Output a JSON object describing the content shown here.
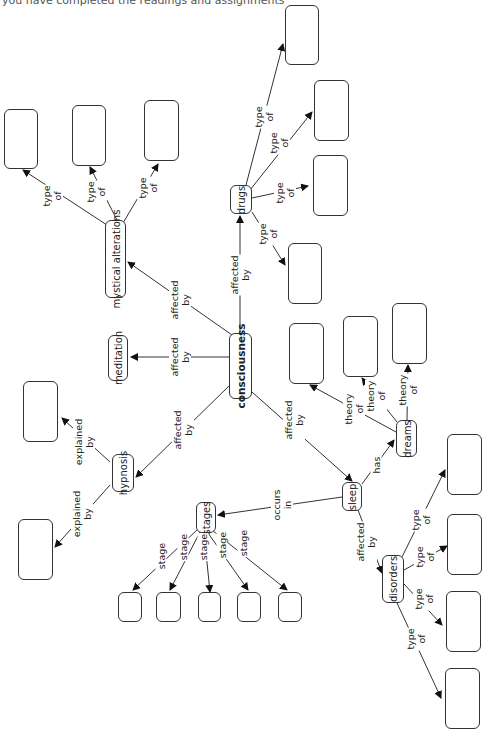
{
  "caption": "you have completed the readings and assignments",
  "concepts": {
    "consciousness": "consciousness",
    "mystical": "mystical alterations",
    "meditation": "meditation",
    "drugs": "drugs",
    "hypnosis": "hypnosis",
    "stages": "stages",
    "sleep": "sleep",
    "dreams": "dreams",
    "disorders": "disorders"
  },
  "links": {
    "affected_by": [
      "affected",
      "by"
    ],
    "type_of": [
      "type",
      "of"
    ],
    "explained_by": [
      "explained",
      "by"
    ],
    "theory_of": [
      "theory",
      "of"
    ],
    "stage": [
      "stage"
    ],
    "occurs_in": [
      "occurs",
      "in"
    ],
    "has": [
      "has"
    ]
  },
  "edge_labels": [
    {
      "id": "c-myst",
      "l1": "affected",
      "l2": "by"
    },
    {
      "id": "c-med",
      "l1": "affected",
      "l2": "by"
    },
    {
      "id": "c-drugs",
      "l1": "affected",
      "l2": "by"
    },
    {
      "id": "c-hyp",
      "l1": "affected",
      "l2": "by"
    },
    {
      "id": "c-sleep",
      "l1": "affected",
      "l2": "by"
    },
    {
      "id": "m-1",
      "l1": "type",
      "l2": "of"
    },
    {
      "id": "m-2",
      "l1": "type",
      "l2": "of"
    },
    {
      "id": "m-3",
      "l1": "type",
      "l2": "of"
    },
    {
      "id": "d-1",
      "l1": "type",
      "l2": "of"
    },
    {
      "id": "d-2",
      "l1": "type",
      "l2": "of"
    },
    {
      "id": "d-3",
      "l1": "type",
      "l2": "of"
    },
    {
      "id": "d-4",
      "l1": "type",
      "l2": "of"
    },
    {
      "id": "h-1",
      "l1": "explained",
      "l2": "by"
    },
    {
      "id": "h-2",
      "l1": "explained",
      "l2": "by"
    },
    {
      "id": "s-occ",
      "l1": "occurs",
      "l2": "in"
    },
    {
      "id": "s-has",
      "l1": "has",
      "l2": ""
    },
    {
      "id": "s-aff",
      "l1": "affected",
      "l2": "by"
    },
    {
      "id": "st-1",
      "l1": "stage",
      "l2": ""
    },
    {
      "id": "st-2",
      "l1": "stage",
      "l2": ""
    },
    {
      "id": "st-3",
      "l1": "stage",
      "l2": ""
    },
    {
      "id": "st-4",
      "l1": "stage",
      "l2": ""
    },
    {
      "id": "st-5",
      "l1": "stage",
      "l2": ""
    },
    {
      "id": "dr-1",
      "l1": "theory",
      "l2": "of"
    },
    {
      "id": "dr-2",
      "l1": "theory",
      "l2": "of"
    },
    {
      "id": "dr-3",
      "l1": "theory",
      "l2": "of"
    },
    {
      "id": "dis-1",
      "l1": "type",
      "l2": "of"
    },
    {
      "id": "dis-2",
      "l1": "type",
      "l2": "of"
    },
    {
      "id": "dis-3",
      "l1": "type",
      "l2": "of"
    },
    {
      "id": "dis-4",
      "l1": "type",
      "l2": "of"
    }
  ],
  "empty_box_count": 24
}
